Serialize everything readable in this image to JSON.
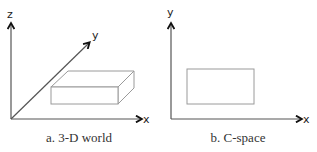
{
  "panels": [
    {
      "id": "3d-world",
      "caption": "a. 3-D world",
      "axes": {
        "z": "z",
        "y": "y",
        "x": "x"
      },
      "object": "rectangular box (3-D)"
    },
    {
      "id": "c-space",
      "caption": "b. C-space",
      "axes": {
        "y": "y",
        "x": "x"
      },
      "object": "rectangle (2-D projection)"
    }
  ],
  "colors": {
    "axis": "#555555",
    "arrowhead": "#111111",
    "shape": "#9a9a9a",
    "text": "#333333"
  }
}
